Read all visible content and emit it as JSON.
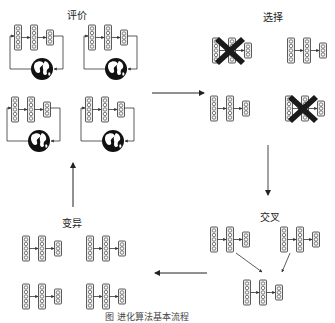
{
  "diagram": {
    "type": "evolutionary-algorithm-flow",
    "stages": [
      {
        "id": "evaluate",
        "label": "评价"
      },
      {
        "id": "select",
        "label": "选择"
      },
      {
        "id": "crossover",
        "label": "交叉"
      },
      {
        "id": "mutate",
        "label": "变异"
      }
    ],
    "caption": "图    进化算法基本流程",
    "colors": {
      "stroke": "#333333",
      "fill": "#e8e8e8",
      "cross": "#1a1a1a",
      "globe": "#111111"
    }
  }
}
